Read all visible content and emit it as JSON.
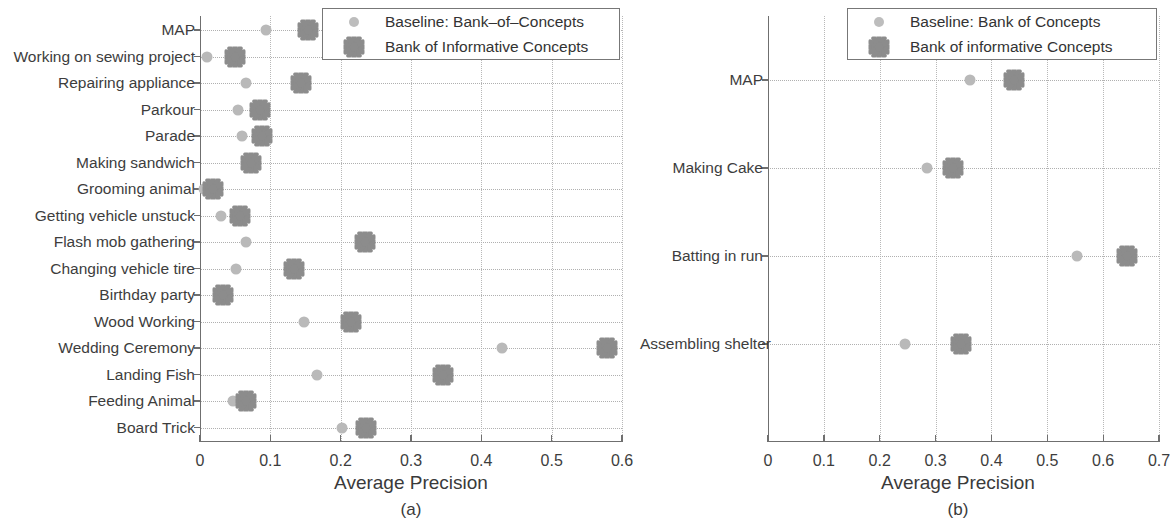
{
  "figure": {
    "colors": {
      "baseline_marker": "#b9b9b9",
      "star_marker": "#8c8c8c",
      "axis": "#6f6f6f",
      "grid": "#b8b8b8",
      "text": "#3a3a3a"
    }
  },
  "panel_a": {
    "caption": "(a)",
    "legend": {
      "baseline_label": "Baseline: Bank–of–Concepts",
      "star_label": "Bank of Informative Concepts"
    }
  },
  "panel_b": {
    "caption": "(b)",
    "legend": {
      "baseline_label": "Baseline: Bank of Concepts",
      "star_label": "Bank of informative Concepts"
    }
  },
  "chart_data": [
    {
      "type": "scatter",
      "panel": "(a)",
      "title": "",
      "xlabel": "Average Precision",
      "ylabel": "",
      "xlim": [
        0,
        0.6
      ],
      "xticks": [
        0,
        0.1,
        0.2,
        0.3,
        0.4,
        0.5,
        0.6
      ],
      "xticklabels": [
        "0",
        "0.1",
        "0.2",
        "0.3",
        "0.4",
        "0.5",
        "0.6"
      ],
      "grid": true,
      "legend_position": "top-right",
      "categories": [
        "MAP",
        "Working on sewing project",
        "Repairing appliance",
        "Parkour",
        "Parade",
        "Making sandwich",
        "Grooming animal",
        "Getting vehicle unstuck",
        "Flash mob gathering",
        "Changing vehicle tire",
        "Birthday party",
        "Wood Working",
        "Wedding Ceremony",
        "Landing Fish",
        "Feeding Animal",
        "Board Trick"
      ],
      "series": [
        {
          "name": "Baseline: Bank–of–Concepts",
          "marker": "circle",
          "values": [
            0.094,
            0.01,
            0.066,
            0.054,
            0.06,
            null,
            0.006,
            0.03,
            0.065,
            0.051,
            null,
            0.148,
            0.43,
            0.166,
            0.047,
            0.202
          ]
        },
        {
          "name": "Bank of Informative Concepts",
          "marker": "star",
          "values": [
            0.153,
            0.05,
            0.143,
            0.085,
            0.088,
            0.072,
            0.019,
            0.057,
            0.235,
            0.133,
            0.033,
            0.215,
            0.578,
            0.345,
            0.066,
            0.236
          ]
        }
      ]
    },
    {
      "type": "scatter",
      "panel": "(b)",
      "title": "",
      "xlabel": "Average Precision",
      "ylabel": "",
      "xlim": [
        0,
        0.75
      ],
      "xticks": [
        0,
        0.1,
        0.2,
        0.3,
        0.4,
        0.5,
        0.6,
        0.7
      ],
      "xticklabels": [
        "0",
        "0.1",
        "0.2",
        "0.3",
        "0.4",
        "0.5",
        "0.6",
        "0.7"
      ],
      "grid": true,
      "legend_position": "top-right",
      "categories": [
        "MAP",
        "Making Cake",
        "Batting in run",
        "Assembling shelter"
      ],
      "series": [
        {
          "name": "Baseline: Bank of Concepts",
          "marker": "circle",
          "values": [
            0.361,
            0.285,
            0.554,
            0.245
          ]
        },
        {
          "name": "Bank of informative Concepts",
          "marker": "star",
          "values": [
            0.441,
            0.331,
            0.643,
            0.345
          ]
        }
      ]
    }
  ]
}
